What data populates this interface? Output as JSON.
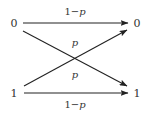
{
  "diagram": {
    "type": "binary-symmetric-channel",
    "inputs": [
      {
        "label": "0",
        "x": 14,
        "y": 23
      },
      {
        "label": "1",
        "x": 14,
        "y": 93
      }
    ],
    "outputs": [
      {
        "label": "0",
        "x": 137,
        "y": 23
      },
      {
        "label": "1",
        "x": 137,
        "y": 93
      }
    ],
    "edges": [
      {
        "from": "0",
        "to": "0",
        "label_prefix": "1−",
        "label_var": "p",
        "label_x": 75,
        "label_y": 15
      },
      {
        "from": "0",
        "to": "1",
        "label_prefix": "",
        "label_var": "p",
        "label_x": 75,
        "label_y": 46
      },
      {
        "from": "1",
        "to": "0",
        "label_prefix": "",
        "label_var": "p",
        "label_x": 75,
        "label_y": 78
      },
      {
        "from": "1",
        "to": "1",
        "label_prefix": "1−",
        "label_var": "p",
        "label_x": 75,
        "label_y": 108
      }
    ],
    "colors": {
      "line": "#222222",
      "text": "#333333",
      "background": "#ffffff"
    }
  }
}
